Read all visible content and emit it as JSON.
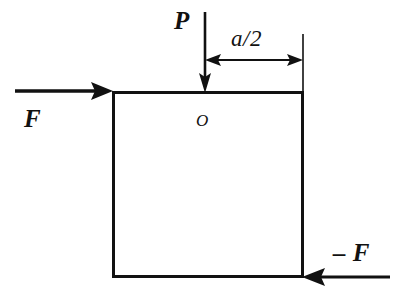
{
  "figure": {
    "type": "free-body-diagram",
    "background_color": "#ffffff",
    "stroke_color": "#111111"
  },
  "body": {
    "shape": "square",
    "label": "square-body",
    "x": 112,
    "y": 91,
    "width": 191,
    "height": 186,
    "stroke_width": 3
  },
  "labels": {
    "load_P": "P",
    "force_F": "F",
    "force_neg_F": "– F",
    "origin_O": "O",
    "dimension_a_half": "a/2"
  },
  "forces": [
    {
      "name": "P",
      "label": "P",
      "direction": "down",
      "application_point": "top edge of square",
      "line_x": 205,
      "start_y": 12,
      "end_y": 91
    },
    {
      "name": "F",
      "label": "F",
      "direction": "right",
      "application_point": "top-left corner of square",
      "line_y": 91,
      "start_x": 15,
      "end_x": 112
    },
    {
      "name": "-F",
      "label": "– F",
      "direction": "left",
      "application_point": "bottom-right corner of square",
      "line_y": 277,
      "start_x": 390,
      "end_x": 303
    }
  ],
  "dimension": {
    "name": "a/2",
    "label": "a/2",
    "line_y": 60,
    "from_x": 205,
    "to_x": 303,
    "arrowheads": "both",
    "extension_line_x": 303,
    "extension_line_top_y": 34,
    "extension_line_bottom_y": 91
  },
  "annotations": {
    "origin_marker": "O",
    "origin_x": 200,
    "origin_y": 118
  }
}
